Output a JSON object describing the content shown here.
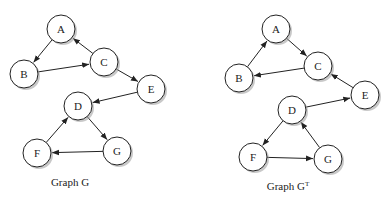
{
  "graphs": [
    {
      "id": "G",
      "caption": "Graph G",
      "caption_superscript": "",
      "nodes": [
        "A",
        "B",
        "C",
        "D",
        "E",
        "F",
        "G"
      ],
      "edges": [
        {
          "from": "A",
          "to": "B"
        },
        {
          "from": "B",
          "to": "C"
        },
        {
          "from": "C",
          "to": "A"
        },
        {
          "from": "C",
          "to": "E"
        },
        {
          "from": "E",
          "to": "D"
        },
        {
          "from": "D",
          "to": "G"
        },
        {
          "from": "G",
          "to": "F"
        },
        {
          "from": "F",
          "to": "D"
        }
      ]
    },
    {
      "id": "GT",
      "caption": "Graph G",
      "caption_superscript": "T",
      "nodes": [
        "A",
        "B",
        "C",
        "D",
        "E",
        "F",
        "G"
      ],
      "edges": [
        {
          "from": "B",
          "to": "A"
        },
        {
          "from": "C",
          "to": "B"
        },
        {
          "from": "A",
          "to": "C"
        },
        {
          "from": "E",
          "to": "C"
        },
        {
          "from": "D",
          "to": "E"
        },
        {
          "from": "G",
          "to": "D"
        },
        {
          "from": "F",
          "to": "G"
        },
        {
          "from": "D",
          "to": "F"
        }
      ]
    }
  ]
}
